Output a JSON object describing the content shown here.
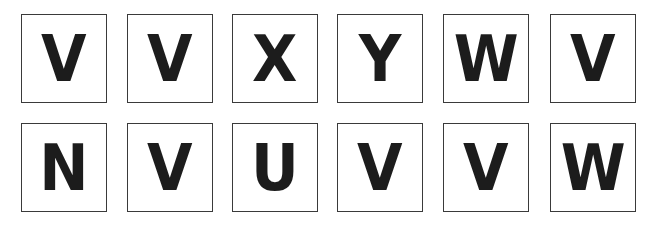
{
  "rows": [
    {
      "tiles": [
        "V",
        "V",
        "X",
        "Y",
        "W",
        "V"
      ]
    },
    {
      "tiles": [
        "N",
        "V",
        "U",
        "V",
        "V",
        "W"
      ]
    }
  ],
  "colors": {
    "letter": "#1c1c1c",
    "border": "#3a3a3a",
    "background": "#ffffff"
  }
}
